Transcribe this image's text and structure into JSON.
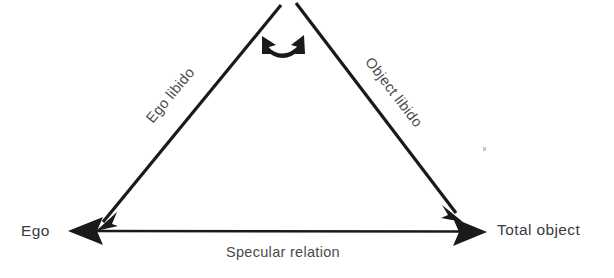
{
  "diagram": {
    "background_color": "#ffffff",
    "line_color": "#1a1a1a",
    "text_color": "#3c3c3c",
    "nodes": [
      {
        "id": "ego",
        "label": "Ego"
      },
      {
        "id": "total_object",
        "label": "Total object"
      }
    ],
    "edges": [
      {
        "id": "ego_libido",
        "label": "Ego libido",
        "from": "apex",
        "to": "ego",
        "arrow": "single",
        "rotation_deg": -50.5
      },
      {
        "id": "object_libido",
        "label": "Object libido",
        "from": "apex",
        "to": "total_object",
        "arrow": "single",
        "rotation_deg": 52.5
      },
      {
        "id": "specular_relation",
        "label": "Specular relation",
        "from": "total_object",
        "to": "ego",
        "arrow": "double",
        "rotation_deg": 0
      },
      {
        "id": "apex_arc",
        "label": "",
        "from": "apex-left",
        "to": "apex-right",
        "arrow": "double-curved",
        "rotation_deg": 0
      }
    ],
    "artifact": {
      "name": "scan-speck",
      "color": "#c9c9c9"
    }
  }
}
